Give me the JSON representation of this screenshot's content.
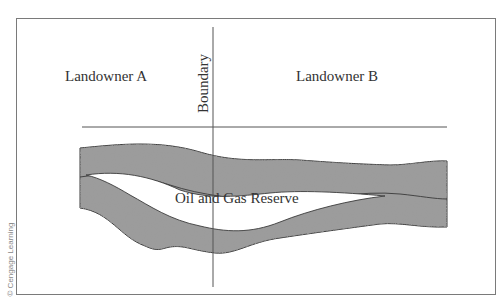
{
  "diagram": {
    "labels": {
      "landowner_a": "Landowner A",
      "landowner_b": "Landowner B",
      "boundary": "Boundary",
      "reserve": "Oil and Gas Reserve"
    },
    "credit": "© Cengage Learning",
    "colors": {
      "frame": "#7a7a7a",
      "lines": "#555555",
      "rock_fill": "#8a8a8a",
      "text": "#333333"
    }
  }
}
